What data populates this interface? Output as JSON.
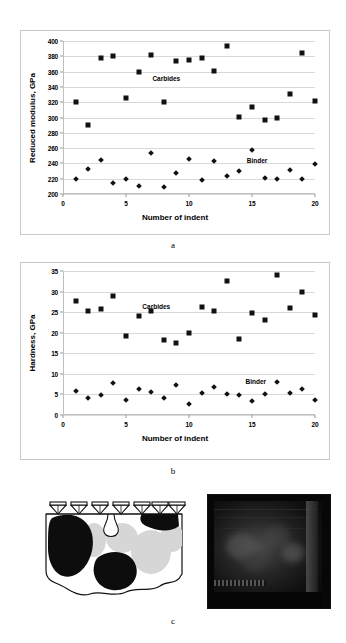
{
  "figure": {
    "panel_letters": {
      "a": "a",
      "b": "b",
      "c": "c"
    }
  },
  "chart_data": [
    {
      "id": "a",
      "type": "scatter",
      "title": "",
      "xlabel": "Number of indent",
      "ylabel": "Reduced modulus, GPa",
      "xlim": [
        0,
        20
      ],
      "ylim": [
        200,
        400
      ],
      "xticks": [
        0,
        5,
        10,
        15,
        20
      ],
      "yticks": [
        200,
        220,
        240,
        260,
        280,
        300,
        320,
        340,
        360,
        380,
        400
      ],
      "grid": true,
      "legend_position": "inline-annotation",
      "annotations": [
        {
          "text": "Carbides",
          "x": 8.2,
          "y": 351
        },
        {
          "text": "Binder",
          "x": 15.4,
          "y": 245
        }
      ],
      "x": [
        1,
        2,
        3,
        4,
        5,
        6,
        7,
        8,
        9,
        10,
        11,
        12,
        13,
        14,
        15,
        16,
        17,
        18,
        19,
        20
      ],
      "series": [
        {
          "name": "Carbides",
          "marker": "square",
          "values": [
            320,
            290,
            378,
            380,
            325,
            360,
            382,
            320,
            374,
            375,
            378,
            361,
            394,
            301,
            314,
            297,
            300,
            331,
            384,
            321
          ]
        },
        {
          "name": "Binder",
          "marker": "diamond",
          "values": [
            220,
            233,
            245,
            214,
            220,
            211,
            254,
            209,
            228,
            246,
            218,
            243,
            224,
            230,
            257,
            221,
            220,
            231,
            220,
            239
          ]
        }
      ]
    },
    {
      "id": "b",
      "type": "scatter",
      "title": "",
      "xlabel": "Number of  indent",
      "ylabel": "Hardness, GPa",
      "xlim": [
        0,
        20
      ],
      "ylim": [
        0,
        35
      ],
      "xticks": [
        0,
        5,
        10,
        15,
        20
      ],
      "yticks": [
        0,
        5,
        10,
        15,
        20,
        25,
        30,
        35
      ],
      "grid": true,
      "legend_position": "inline-annotation",
      "annotations": [
        {
          "text": "Carbides",
          "x": 7.4,
          "y": 26.6
        },
        {
          "text": "Binder",
          "x": 15.3,
          "y": 8.2
        }
      ],
      "x": [
        1,
        2,
        3,
        4,
        5,
        6,
        7,
        8,
        9,
        10,
        11,
        12,
        13,
        14,
        15,
        16,
        17,
        18,
        19,
        20
      ],
      "series": [
        {
          "name": "Carbides",
          "marker": "square",
          "values": [
            27.7,
            25.2,
            25.7,
            29.0,
            19.3,
            24.0,
            25.3,
            18.3,
            17.4,
            19.9,
            26.3,
            25.3,
            32.5,
            18.5,
            24.9,
            23.1,
            34.0,
            26.0,
            29.9,
            24.2
          ]
        },
        {
          "name": "Binder",
          "marker": "diamond",
          "values": [
            5.8,
            4.1,
            4.8,
            7.7,
            3.6,
            6.2,
            5.6,
            4.1,
            7.2,
            2.6,
            5.3,
            6.8,
            5.2,
            4.8,
            3.3,
            5.1,
            8.0,
            5.4,
            6.4,
            3.7
          ]
        }
      ]
    }
  ],
  "panel_c": {
    "schematic": {
      "name": "indentation-schematic",
      "indenter_count": 7,
      "description": "Berkovich indenters on a cemented carbide cross-section"
    },
    "micrograph": {
      "name": "sem-micrograph",
      "description": "Dark SEM image of indented carbide surface"
    }
  }
}
